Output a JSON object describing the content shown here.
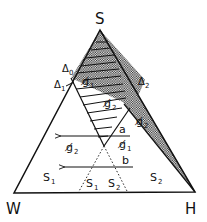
{
  "diagram": {
    "type": "ternary-phase-diagram",
    "vertices": {
      "top": "S",
      "bottom_left": "W",
      "bottom_right": "H"
    },
    "boundary_labels": {
      "delta0": "Δ",
      "delta0_sub": "0",
      "delta1": "Δ",
      "delta1_sub": "1",
      "delta2": "Δ",
      "delta2_sub": "2"
    },
    "regions": {
      "upper_g1": {
        "symbol": "g̸",
        "sub": "1"
      },
      "upper_g2": {
        "symbol": "g̸",
        "sub": "2"
      },
      "right_wedge_g2": {
        "symbol": "g̸",
        "sub": "2"
      },
      "left_g2": {
        "symbol": "g̸",
        "sub": "2"
      },
      "center_g1": {
        "symbol": "g̸",
        "sub": "1"
      },
      "left_s1": {
        "symbol": "S",
        "sub": "1"
      },
      "lower_s1": {
        "symbol": "S",
        "sub": "1"
      },
      "lower_s2": {
        "symbol": "S",
        "sub": "2"
      },
      "right_s2": {
        "symbol": "S",
        "sub": "2"
      }
    },
    "paths": {
      "a": "a",
      "b": "b"
    },
    "colors": {
      "line": "#111111",
      "background": "#ffffff"
    }
  }
}
